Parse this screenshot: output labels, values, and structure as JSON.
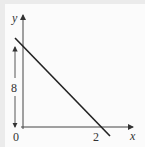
{
  "diagram": {
    "type": "line-graph",
    "axes": {
      "x_label": "x",
      "y_label": "y",
      "origin_label": "0"
    },
    "x_intercept_label": "2",
    "height_dimension_label": "8",
    "line": {
      "description": "straight line with negative slope crossing x-axis at 2, height 8 marked on y-axis",
      "x_intercept": 2,
      "y_intercept": 8
    },
    "colors": {
      "background": "#ebebeb",
      "panel": "#fbfbfb",
      "ink": "#333333"
    }
  }
}
